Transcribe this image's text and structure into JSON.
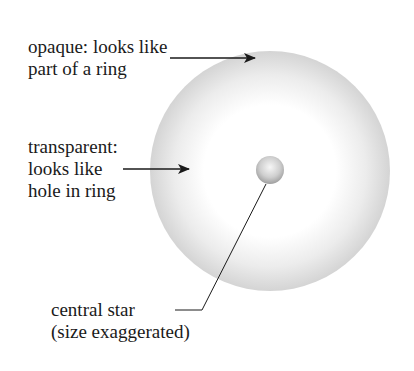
{
  "diagram": {
    "labels": {
      "opaque": {
        "line1": "opaque: looks like",
        "line2": "part of a ring"
      },
      "transparent": {
        "line1": "transparent:",
        "line2": "looks like",
        "line3": "hole in ring"
      },
      "star": {
        "line1": "central star",
        "line2": "(size exaggerated)"
      }
    },
    "shapes": {
      "shell": {
        "cx": 270,
        "cy": 171,
        "r": 120,
        "edge_color": "#d6d6d6",
        "center_color": "#ffffff"
      },
      "star": {
        "cx": 270,
        "cy": 170,
        "r": 14,
        "highlight": "#f4f4f4",
        "shade": "#a9a9a9"
      },
      "line_color": "#1a1a1a"
    }
  }
}
